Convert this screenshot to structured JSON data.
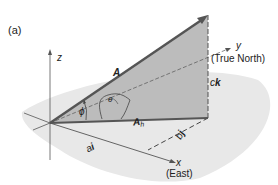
{
  "figure": {
    "panel_label": "(a)",
    "axes": {
      "z": "z",
      "y": "y",
      "y_note": "(True North)",
      "x": "x",
      "x_note": "(East)"
    },
    "vectors": {
      "A": "A",
      "Ah": "A",
      "Ah_sub": "h"
    },
    "components": {
      "ck_prefix": "c",
      "ck_vec": "k",
      "ai_prefix": "a",
      "ai_vec": "i",
      "bj_prefix": "b",
      "bj_vec": "j"
    },
    "angles": {
      "phi": "ϕ",
      "theta": "θ"
    },
    "colors": {
      "ground": "#e6e6e6",
      "vertical_plane": "#b9b9b9",
      "vector": "#555555",
      "axis": "#444444"
    }
  }
}
